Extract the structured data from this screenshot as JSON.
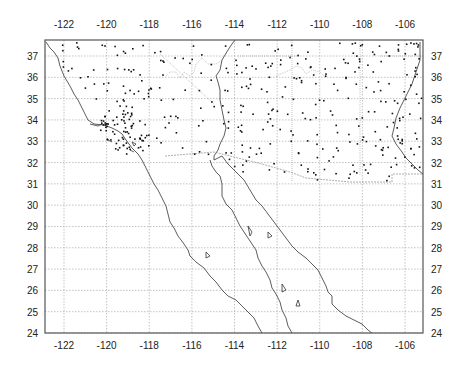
{
  "map": {
    "projection": "lon-lat",
    "region": "Southwestern US and Baja California / Gulf of California",
    "lon_range": [
      -123,
      -105.3
    ],
    "lat_range": [
      24,
      37.8
    ],
    "x_ticks_top": [
      "-122",
      "-120",
      "-118",
      "-116",
      "-114",
      "-112",
      "-110",
      "-108",
      "-106"
    ],
    "x_ticks_bottom": [
      "-122",
      "-120",
      "-118",
      "-116",
      "-114",
      "-112",
      "-110",
      "-108",
      "-106"
    ],
    "y_ticks_left": [
      "37",
      "36",
      "35",
      "34",
      "33",
      "32",
      "31",
      "30",
      "29",
      "28",
      "27",
      "26",
      "25",
      "24"
    ],
    "y_ticks_right": [
      "37",
      "36",
      "35",
      "34",
      "33",
      "32",
      "31",
      "30",
      "29",
      "28",
      "27",
      "26",
      "25",
      "24"
    ],
    "grid": true,
    "layers": [
      "coastlines",
      "international border",
      "state boundaries",
      "station points"
    ],
    "colors": {
      "frame": "#555555",
      "grid": "#9a9a9a",
      "coast": "#333333",
      "points": "#111111"
    }
  }
}
